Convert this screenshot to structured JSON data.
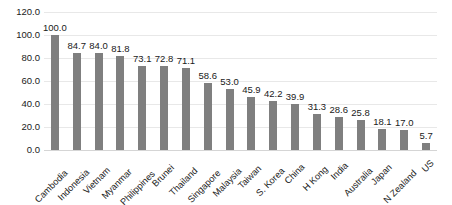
{
  "chart_data": {
    "type": "bar",
    "title": "",
    "xlabel": "",
    "ylabel": "",
    "ylim": [
      0,
      120
    ],
    "ytick_step": 20,
    "ytick_labels": [
      "0.0",
      "20.0",
      "40.0",
      "60.0",
      "80.0",
      "100.0",
      "120.0"
    ],
    "ytick_values": [
      0,
      20,
      40,
      60,
      80,
      100,
      120
    ],
    "grid": true,
    "legend": false,
    "bar_color": "#7f7f7f",
    "value_label_format": "one-decimal",
    "xtick_rotation_degrees": -45,
    "categories": [
      "Cambodia",
      "Indonesia",
      "Vietnam",
      "Myanmar",
      "Philippines",
      "Brunei",
      "Thailand",
      "Singapore",
      "Malaysia",
      "Taiwan",
      "S. Korea",
      "China",
      "H Kong",
      "India",
      "Australia",
      "Japan",
      "N Zealand",
      "US"
    ],
    "values": [
      100.0,
      84.7,
      84.0,
      81.8,
      73.1,
      72.8,
      71.1,
      58.6,
      53.0,
      45.9,
      42.2,
      39.9,
      31.3,
      28.6,
      25.8,
      18.1,
      17.0,
      5.7
    ],
    "value_labels": [
      "100.0",
      "84.7",
      "84.0",
      "81.8",
      "73.1",
      "72.8",
      "71.1",
      "58.6",
      "53.0",
      "45.9",
      "42.2",
      "39.9",
      "31.3",
      "28.6",
      "25.8",
      "18.1",
      "17.0",
      "5.7"
    ]
  }
}
